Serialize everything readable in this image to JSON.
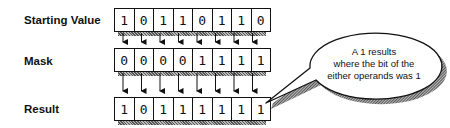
{
  "diagram": {
    "rows": [
      {
        "label": "Starting Value",
        "bits": [
          "1",
          "0",
          "1",
          "1",
          "0",
          "1",
          "1",
          "0"
        ]
      },
      {
        "label": "Mask",
        "bits": [
          "0",
          "0",
          "0",
          "0",
          "1",
          "1",
          "1",
          "1"
        ]
      },
      {
        "label": "Result",
        "bits": [
          "1",
          "0",
          "1",
          "1",
          "1",
          "1",
          "1",
          "1"
        ]
      }
    ],
    "callout": {
      "lines": [
        "A 1 results",
        "where the bit of the",
        "either operands was 1"
      ]
    }
  }
}
